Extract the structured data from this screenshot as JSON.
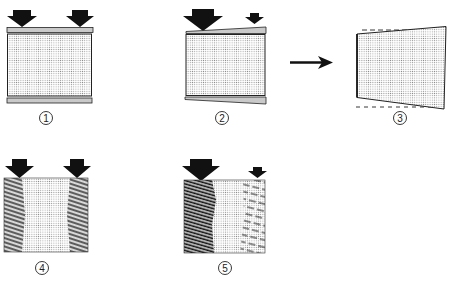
{
  "diagram": {
    "type": "load-distribution / wedge-compression illustration",
    "colors": {
      "ink": "#1a1a1a",
      "stipple": "#9a9a9a",
      "background": "#ffffff"
    },
    "panels": [
      {
        "id": 1,
        "label": "1",
        "description": "Rectangular block with equal load arrows on both sides; parallel top and bottom plates",
        "arrows": [
          {
            "size": "large",
            "position": "left"
          },
          {
            "size": "large",
            "position": "right"
          }
        ]
      },
      {
        "id": 2,
        "label": "2",
        "description": "Rectangular block with unequal loads (large left, small right); tapered wedge plates top and bottom",
        "arrows": [
          {
            "size": "large",
            "position": "left"
          },
          {
            "size": "small",
            "position": "right"
          }
        ]
      },
      {
        "id": 3,
        "label": "3",
        "description": "Resulting trapezoidal deformation; dashed lines show original outline",
        "arrows": []
      },
      {
        "id": 4,
        "label": "4",
        "description": "Block with equal loads; hatched stress zones on both sides",
        "arrows": [
          {
            "size": "large",
            "position": "left"
          },
          {
            "size": "large",
            "position": "right"
          }
        ]
      },
      {
        "id": 5,
        "label": "5",
        "description": "Block with unequal loads; heavy hatching on left, light hatching on right",
        "arrows": [
          {
            "size": "large",
            "position": "left"
          },
          {
            "size": "small",
            "position": "right"
          }
        ]
      }
    ],
    "transition_arrow": {
      "from": 2,
      "to": 3,
      "direction": "right"
    }
  }
}
